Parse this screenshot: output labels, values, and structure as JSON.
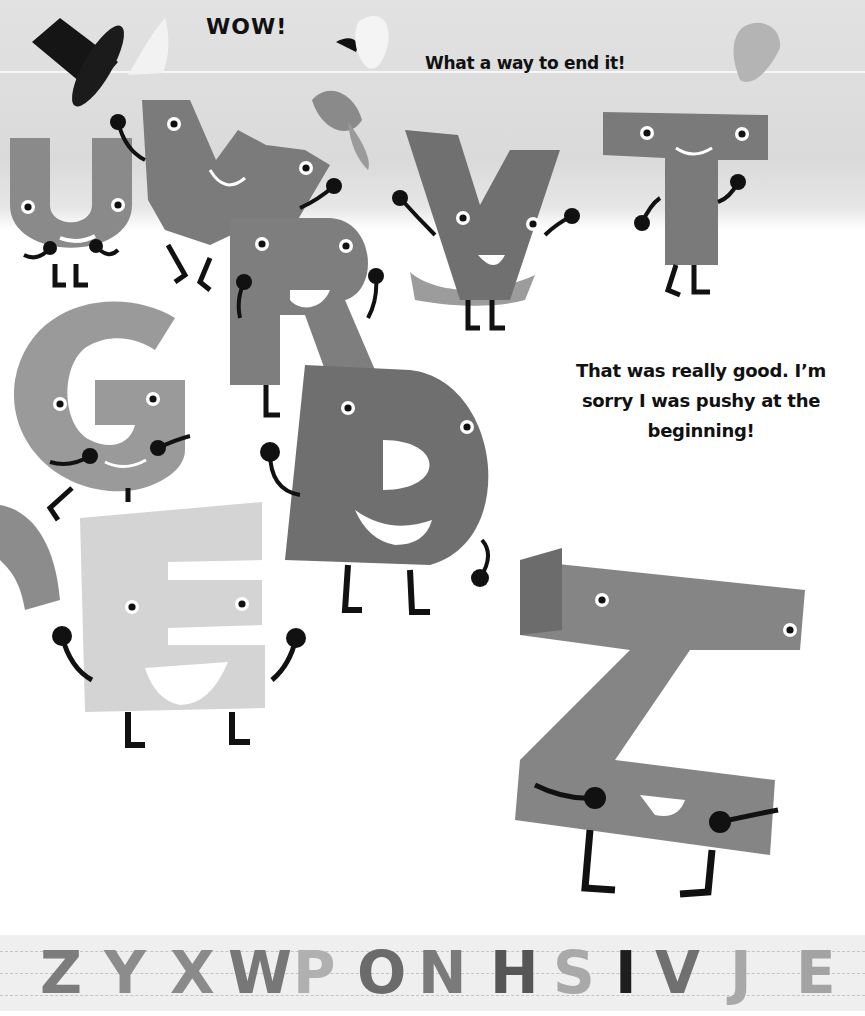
{
  "page": {
    "texts": {
      "wow": "WOW!",
      "end_line": "What a way to end it!",
      "speech": "That was really good. I’m sorry I was pushy at the beginning!"
    },
    "colors": {
      "sky": "#dcdcdc",
      "ground": "#ffffff",
      "ink": "#111111"
    },
    "characters": [
      {
        "letter": "U",
        "shade": "#8a8a8a"
      },
      {
        "letter": "W",
        "shade": "#7b7b7b"
      },
      {
        "letter": "R",
        "shade": "#7e7e7e"
      },
      {
        "letter": "V",
        "shade": "#707070"
      },
      {
        "letter": "T",
        "shade": "#7a7a7a"
      },
      {
        "letter": "G",
        "shade": "#9a9a9a"
      },
      {
        "letter": "D",
        "shade": "#6f6f6f"
      },
      {
        "letter": "E",
        "shade": "#d4d4d4"
      },
      {
        "letter": "Z",
        "shade": "#858585"
      }
    ],
    "hats": [
      "top-hat",
      "white-bonnet",
      "sailor-cap",
      "baseball-cap",
      "beanie"
    ],
    "alphabet_strip": {
      "letters": [
        {
          "char": "Z",
          "color": "#7c7c7c",
          "x": 40
        },
        {
          "char": "Y",
          "color": "#8c8c8c",
          "x": 104
        },
        {
          "char": "X",
          "color": "#8a8a8a",
          "x": 170
        },
        {
          "char": "W",
          "color": "#777777",
          "x": 228
        },
        {
          "char": "P",
          "color": "#b0b0b0",
          "x": 293
        },
        {
          "char": "O",
          "color": "#6b6b6b",
          "x": 357
        },
        {
          "char": "N",
          "color": "#7a7a7a",
          "x": 418
        },
        {
          "char": "H",
          "color": "#565656",
          "x": 490
        },
        {
          "char": "S",
          "color": "#a9a9a9",
          "x": 553
        },
        {
          "char": "I",
          "color": "#1e1e1e",
          "x": 615
        },
        {
          "char": "V",
          "color": "#707070",
          "x": 655
        },
        {
          "char": "J",
          "color": "#a8a8a8",
          "x": 730
        },
        {
          "char": "E",
          "color": "#a3a3a3",
          "x": 796
        }
      ]
    }
  }
}
